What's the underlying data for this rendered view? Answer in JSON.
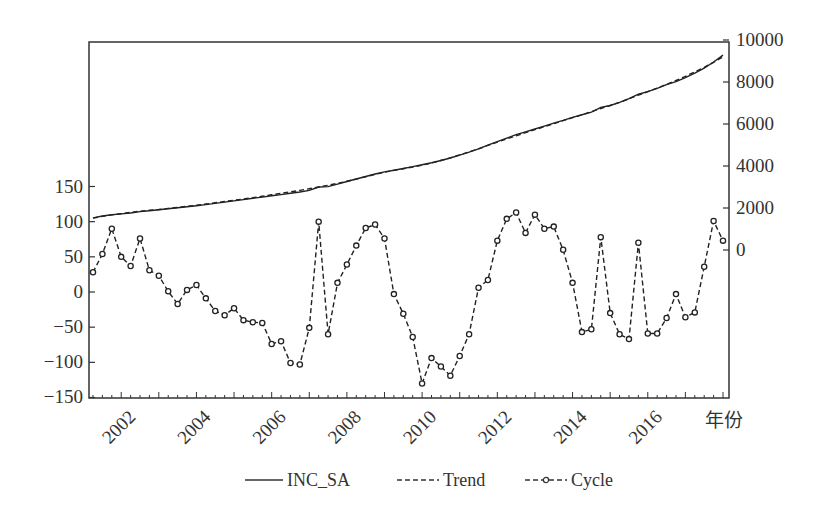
{
  "chart_data": {
    "type": "line",
    "title": "",
    "xlabel": "年份",
    "ylabel_left": "",
    "ylabel_right": "",
    "x_tick_labels": [
      "2002",
      "2004",
      "2006",
      "2008",
      "2010",
      "2012",
      "2014",
      "2016"
    ],
    "x_range": [
      "2001Q1",
      "2017Q4"
    ],
    "frequency": "quarterly",
    "left_axis": {
      "ticks": [
        150,
        100,
        50,
        0,
        -50,
        -100,
        -150
      ],
      "ylim": [
        -150,
        150
      ],
      "series": [
        "Cycle"
      ]
    },
    "right_axis": {
      "ticks": [
        10000,
        8000,
        6000,
        4000,
        2000,
        0
      ],
      "ylim": [
        0,
        10000
      ],
      "series": [
        "INC_SA",
        "Trend"
      ]
    },
    "grid": false,
    "legend_position": "bottom",
    "legend": [
      {
        "name": "INC_SA",
        "style": "solid"
      },
      {
        "name": "Trend",
        "style": "dashed"
      },
      {
        "name": "Cycle",
        "style": "dashed-circle-markers"
      }
    ],
    "series": [
      {
        "name": "Cycle",
        "axis": "left",
        "values": [
          28,
          54,
          90,
          50,
          37,
          76,
          31,
          23,
          1,
          -17,
          3,
          10,
          -9,
          -27,
          -33,
          -23,
          -40,
          -43,
          -44,
          -74,
          -70,
          -101,
          -103,
          -51,
          100,
          -60,
          13,
          39,
          66,
          91,
          96,
          76,
          -3,
          -31,
          -64,
          -130,
          -94,
          -106,
          -119,
          -91,
          -60,
          6,
          17,
          73,
          104,
          113,
          84,
          110,
          90,
          93,
          60,
          13,
          -57,
          -53,
          78,
          -30,
          -60,
          -67,
          70,
          -59,
          -59,
          -37,
          -3,
          -36,
          -29,
          36,
          101,
          73
        ]
      },
      {
        "name": "INC_SA",
        "axis": "right",
        "values": [
          1530,
          1620,
          1680,
          1720,
          1760,
          1830,
          1870,
          1920,
          1960,
          2010,
          2060,
          2110,
          2160,
          2220,
          2280,
          2340,
          2400,
          2460,
          2520,
          2580,
          2640,
          2700,
          2760,
          2840,
          3000,
          3020,
          3140,
          3260,
          3380,
          3500,
          3620,
          3720,
          3800,
          3880,
          3970,
          4060,
          4150,
          4260,
          4380,
          4520,
          4660,
          4820,
          4990,
          5160,
          5330,
          5490,
          5630,
          5760,
          5900,
          6040,
          6170,
          6320,
          6440,
          6560,
          6790,
          6880,
          7030,
          7210,
          7420,
          7540,
          7700,
          7870,
          8020,
          8210,
          8420,
          8660,
          8950,
          9280
        ]
      },
      {
        "name": "Trend",
        "axis": "right",
        "values": [
          1520,
          1600,
          1670,
          1730,
          1790,
          1850,
          1890,
          1930,
          1980,
          2030,
          2080,
          2130,
          2190,
          2250,
          2310,
          2370,
          2430,
          2490,
          2560,
          2630,
          2700,
          2770,
          2840,
          2920,
          3000,
          3080,
          3170,
          3270,
          3380,
          3490,
          3600,
          3700,
          3790,
          3870,
          3950,
          4040,
          4140,
          4260,
          4390,
          4530,
          4670,
          4820,
          4980,
          5140,
          5290,
          5440,
          5590,
          5730,
          5870,
          6010,
          6160,
          6300,
          6440,
          6590,
          6740,
          6880,
          7030,
          7200,
          7370,
          7540,
          7710,
          7890,
          8070,
          8270,
          8480,
          8700,
          8940,
          9200
        ]
      }
    ]
  }
}
